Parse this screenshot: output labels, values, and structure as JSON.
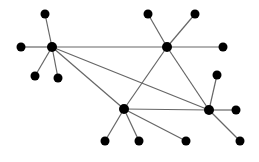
{
  "diagram": {
    "type": "network-graph",
    "colors": {
      "node": "#000000",
      "edge": "#666666",
      "background": "#ffffff"
    },
    "nodes": [
      {
        "id": "A",
        "x": 52,
        "y": 47,
        "r": 5,
        "role": "hub"
      },
      {
        "id": "B",
        "x": 167,
        "y": 47,
        "r": 5,
        "role": "hub"
      },
      {
        "id": "C",
        "x": 124,
        "y": 109,
        "r": 5,
        "role": "hub"
      },
      {
        "id": "D",
        "x": 209,
        "y": 110,
        "r": 5,
        "role": "hub"
      },
      {
        "id": "a1",
        "x": 45,
        "y": 14,
        "r": 4.5,
        "role": "leaf"
      },
      {
        "id": "a2",
        "x": 21,
        "y": 47,
        "r": 4.5,
        "role": "leaf"
      },
      {
        "id": "a3",
        "x": 35,
        "y": 76,
        "r": 4.5,
        "role": "leaf"
      },
      {
        "id": "a4",
        "x": 58,
        "y": 78,
        "r": 4.5,
        "role": "leaf"
      },
      {
        "id": "b1",
        "x": 148,
        "y": 14,
        "r": 4.5,
        "role": "leaf"
      },
      {
        "id": "b2",
        "x": 195,
        "y": 14,
        "r": 4.5,
        "role": "leaf"
      },
      {
        "id": "b3",
        "x": 223,
        "y": 47,
        "r": 4.5,
        "role": "leaf"
      },
      {
        "id": "c1",
        "x": 105,
        "y": 141,
        "r": 4.5,
        "role": "leaf"
      },
      {
        "id": "c2",
        "x": 139,
        "y": 141,
        "r": 4.5,
        "role": "leaf"
      },
      {
        "id": "c3",
        "x": 186,
        "y": 141,
        "r": 4.5,
        "role": "leaf"
      },
      {
        "id": "d1",
        "x": 217,
        "y": 75,
        "r": 4.5,
        "role": "leaf"
      },
      {
        "id": "d2",
        "x": 236,
        "y": 110,
        "r": 4.5,
        "role": "leaf"
      },
      {
        "id": "d3",
        "x": 240,
        "y": 141,
        "r": 4.5,
        "role": "leaf"
      }
    ],
    "edges": [
      [
        "A",
        "B"
      ],
      [
        "A",
        "C"
      ],
      [
        "A",
        "D"
      ],
      [
        "B",
        "C"
      ],
      [
        "B",
        "D"
      ],
      [
        "C",
        "D"
      ],
      [
        "A",
        "a1"
      ],
      [
        "A",
        "a2"
      ],
      [
        "A",
        "a3"
      ],
      [
        "A",
        "a4"
      ],
      [
        "B",
        "b1"
      ],
      [
        "B",
        "b2"
      ],
      [
        "B",
        "b3"
      ],
      [
        "C",
        "c1"
      ],
      [
        "C",
        "c2"
      ],
      [
        "C",
        "c3"
      ],
      [
        "D",
        "d1"
      ],
      [
        "D",
        "d2"
      ],
      [
        "D",
        "d3"
      ]
    ]
  }
}
